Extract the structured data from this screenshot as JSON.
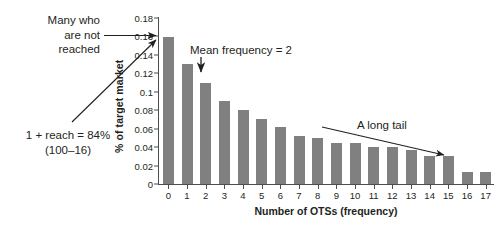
{
  "chart_data": {
    "type": "bar",
    "title": "",
    "xlabel": "Number of OTSs (frequency)",
    "ylabel": "% of target market",
    "categories": [
      "0",
      "1",
      "2",
      "3",
      "4",
      "5",
      "6",
      "7",
      "8",
      "9",
      "10",
      "11",
      "12",
      "13",
      "14",
      "15",
      "16",
      "17"
    ],
    "values": [
      0.159,
      0.13,
      0.11,
      0.09,
      0.08,
      0.071,
      0.062,
      0.052,
      0.05,
      0.045,
      0.045,
      0.04,
      0.04,
      0.037,
      0.03,
      0.03,
      0.013,
      0.013
    ],
    "ylim": [
      0,
      0.18
    ],
    "ytick_labels": [
      "0.18",
      "0.16",
      "0.14",
      "0.12",
      "0.1",
      "0.08",
      "0.06",
      "0.04",
      "0.02",
      "0"
    ],
    "ytick_values": [
      0.18,
      0.16,
      0.14,
      0.12,
      0.1,
      0.08,
      0.06,
      0.04,
      0.02,
      0
    ],
    "grid": false,
    "legend": false,
    "bar_color": "#808080",
    "axis_color": "#4d4d4d",
    "text_color": "#231f20",
    "annotations": [
      {
        "name": "many-who-are-not-reached",
        "lines": [
          "Many who",
          "are not",
          "reached"
        ],
        "target": "bar-0"
      },
      {
        "name": "one-plus-reach",
        "lines": [
          "1 + reach = 84%",
          "(100–16)"
        ],
        "target": "bar-0"
      },
      {
        "name": "mean-frequency",
        "lines": [
          "Mean frequency = 2"
        ],
        "target": "bar-2"
      },
      {
        "name": "a-long-tail",
        "lines": [
          "A long tail"
        ],
        "target": "tail-bars"
      }
    ]
  }
}
